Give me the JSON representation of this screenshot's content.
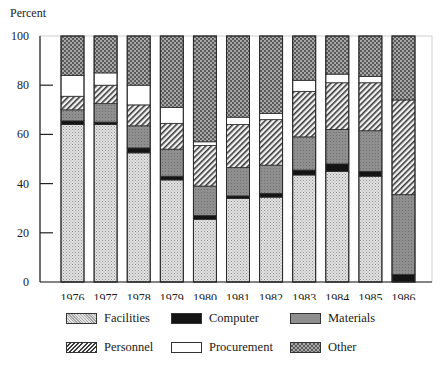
{
  "chart_data": {
    "type": "bar",
    "stacked": true,
    "title": "",
    "xlabel": "",
    "ylabel": "Percent",
    "ylim": [
      0,
      100
    ],
    "yticks": [
      0,
      20,
      40,
      60,
      80,
      100
    ],
    "grid": false,
    "legend_position": "bottom",
    "categories": [
      "1976",
      "1977",
      "1978",
      "1979",
      "1980",
      "1981",
      "1982",
      "1983",
      "1984",
      "1985",
      "1986"
    ],
    "series": [
      {
        "name": "Facilities",
        "pattern": "light-dots",
        "color": "#cfcfcf",
        "values": [
          64,
          64,
          52.5,
          41.5,
          25.5,
          34,
          34.5,
          43.5,
          45,
          43,
          0
        ]
      },
      {
        "name": "Computer",
        "pattern": "solid-black",
        "color": "#111111",
        "values": [
          1.5,
          1,
          2,
          1.5,
          1.5,
          1,
          1.5,
          2,
          3,
          2,
          3
        ]
      },
      {
        "name": "Materials",
        "pattern": "medium-gray",
        "color": "#8a8a8a",
        "values": [
          4.5,
          7.5,
          9,
          11,
          12,
          11.5,
          11.5,
          13.5,
          14,
          16.5,
          32.5
        ]
      },
      {
        "name": "Personnel",
        "pattern": "diagonal-hatch",
        "color": "#bdbdbd",
        "values": [
          5.5,
          7.5,
          8.5,
          10.5,
          16.5,
          17.5,
          18.5,
          18.5,
          19,
          19.5,
          38.5
        ]
      },
      {
        "name": "Procurement",
        "pattern": "white",
        "color": "#ffffff",
        "values": [
          8.5,
          5,
          8,
          6.5,
          1.5,
          3,
          2.5,
          4.5,
          3.5,
          2.5,
          0
        ]
      },
      {
        "name": "Other",
        "pattern": "dark-checker",
        "color": "#6e6e6e",
        "values": [
          16,
          15,
          20,
          29,
          43,
          33,
          31.5,
          18,
          15.5,
          16.5,
          26
        ]
      }
    ]
  },
  "axis": {
    "y_title": "Percent"
  },
  "legend": {
    "items": [
      {
        "label": "Facilities"
      },
      {
        "label": "Computer"
      },
      {
        "label": "Materials"
      },
      {
        "label": "Personnel"
      },
      {
        "label": "Procurement"
      },
      {
        "label": "Other"
      }
    ]
  }
}
